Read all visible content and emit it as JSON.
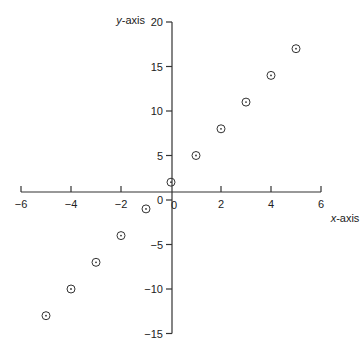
{
  "chart_data": {
    "type": "scatter",
    "title": "",
    "xlabel": "x-axis",
    "ylabel": "y-axis",
    "xlabel_italic_part": "x",
    "xlabel_rest": "-axis",
    "ylabel_italic_part": "y",
    "ylabel_rest": "-axis",
    "xlim": [
      -6,
      6
    ],
    "ylim": [
      -15,
      20
    ],
    "x_ticks": [
      -6,
      -4,
      -2,
      0,
      2,
      4,
      6
    ],
    "x_tick_labels": [
      "−6",
      "−4",
      "−2",
      "0",
      "2",
      "4",
      "6"
    ],
    "y_ticks": [
      -15,
      -10,
      -5,
      0,
      5,
      10,
      15,
      20
    ],
    "y_tick_labels": [
      "−15",
      "−10",
      "−5",
      "0",
      "5",
      "10",
      "15",
      "20"
    ],
    "grid": false,
    "legend": null,
    "marker": "circle-dot",
    "series": [
      {
        "name": "y = 3x + 2",
        "x": [
          -5,
          -4,
          -3,
          -2,
          -1,
          0,
          1,
          2,
          3,
          4,
          5
        ],
        "y": [
          -13,
          -10,
          -7,
          -4,
          -1,
          2,
          5,
          8,
          11,
          14,
          17
        ]
      }
    ]
  },
  "colors": {
    "axis": "#333333",
    "marker": "#333333",
    "text": "#222222",
    "background": "#ffffff"
  }
}
